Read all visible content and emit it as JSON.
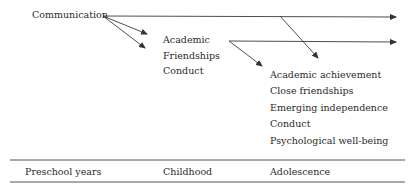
{
  "diagram": {
    "source_node": "Communication",
    "childhood_outcomes": [
      "Academic",
      "Friendships",
      "Conduct"
    ],
    "adolescence_outcomes": [
      "Academic achievement",
      "Close friendships",
      "Emerging independence",
      "Conduct",
      "Psychological well-being"
    ],
    "timeline": [
      "Preschool years",
      "Childhood",
      "Adolescence"
    ]
  },
  "colors": {
    "line": "#3a3a3a",
    "text": "#2a2a2a",
    "rule": "#555555"
  }
}
